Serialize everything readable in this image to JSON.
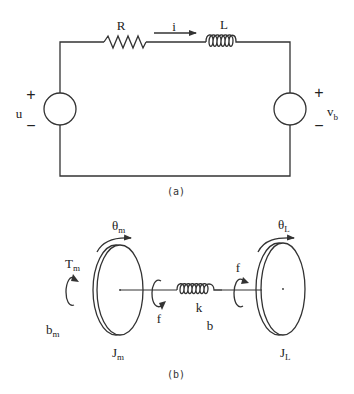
{
  "figure_a": {
    "caption": "(a)",
    "resistor_label": "R",
    "inductor_label": "L",
    "current_label": "i",
    "source_left": {
      "label": "u",
      "plus": "+",
      "minus": "−"
    },
    "source_right": {
      "label": "v",
      "label_sub": "b",
      "plus": "+",
      "minus": "−"
    }
  },
  "figure_b": {
    "caption": "(b)",
    "motor_angle": {
      "label": "θ",
      "sub": "m"
    },
    "load_angle": {
      "label": "θ",
      "sub": "L"
    },
    "motor_torque": {
      "label": "T",
      "sub": "m"
    },
    "motor_damping": {
      "label": "b",
      "sub": "m"
    },
    "motor_inertia": {
      "label": "J",
      "sub": "m"
    },
    "load_inertia": {
      "label": "J",
      "sub": "L"
    },
    "spring_label": "k",
    "shaft_damping_label": "b",
    "friction_left_label": "f",
    "friction_right_label": "f"
  }
}
